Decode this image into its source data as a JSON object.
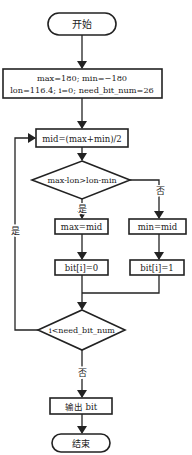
{
  "nodes": {
    "start": "开始",
    "init_line1": "max=180; min=−180",
    "init_line2": "lon=116.4; i=0; need_bit_num=26",
    "mid": "mid=(max+min)/2",
    "cond1": "max-lon>lon-min",
    "max_eq_mid": "max=mid",
    "min_eq_mid": "min=mid",
    "bit0": "bit[i]=0",
    "bit1": "bit[i]=1",
    "cond2": "i<need_bit_num",
    "output": "输出 bit",
    "end": "结束"
  },
  "labels": {
    "yes_cond1": "是",
    "no_cond1": "否",
    "yes_loop": "是",
    "no_cond2": "否"
  }
}
